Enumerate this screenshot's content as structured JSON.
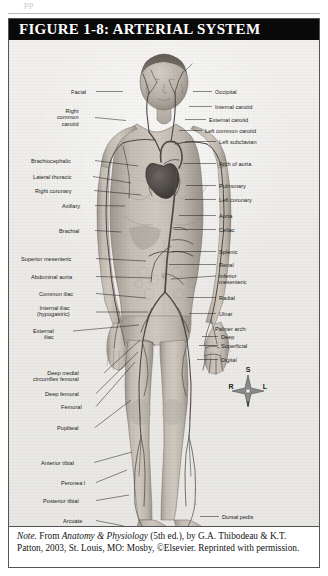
{
  "page": {
    "top_partial_text": "pp"
  },
  "figure": {
    "title": "FIGURE 1-8: ARTERIAL SYSTEM",
    "alt": "Anterior view of the human body showing the major systemic arteries"
  },
  "labels_left": [
    {
      "text": "Facial",
      "x": 62,
      "y": 49,
      "lx1": 87,
      "ly1": 51.5,
      "lx2": 114,
      "ly2": 51.5
    },
    {
      "text": "Right\ncommon\ncarotid",
      "x": 48,
      "y": 68,
      "lx1": 86,
      "ly1": 77.5,
      "lx2": 117,
      "ly2": 80.5
    },
    {
      "text": "Brachiocephalic",
      "x": 22,
      "y": 118,
      "lx1": 86,
      "ly1": 120.5,
      "lx2": 129,
      "ly2": 126
    },
    {
      "text": "Lateral thoracic",
      "x": 24,
      "y": 134,
      "lx1": 84,
      "ly1": 136.5,
      "lx2": 122,
      "ly2": 143
    },
    {
      "text": "Right coronary",
      "x": 26,
      "y": 148,
      "lx1": 85,
      "ly1": 150.5,
      "lx2": 132,
      "ly2": 155
    },
    {
      "text": "Axillary",
      "x": 53,
      "y": 163,
      "lx1": 86,
      "ly1": 165.5,
      "lx2": 116,
      "ly2": 166
    },
    {
      "text": "Brachial",
      "x": 50,
      "y": 188,
      "lx1": 86,
      "ly1": 190.5,
      "lx2": 112,
      "ly2": 192
    },
    {
      "text": "Superior mesenteric",
      "x": 12,
      "y": 216,
      "lx1": 87,
      "ly1": 218.5,
      "lx2": 137,
      "ly2": 221
    },
    {
      "text": "Abdominal aorta",
      "x": 22,
      "y": 234,
      "lx1": 87,
      "ly1": 236.5,
      "lx2": 143,
      "ly2": 238
    },
    {
      "text": "Common iliac",
      "x": 30,
      "y": 251,
      "lx1": 87,
      "ly1": 253.5,
      "lx2": 137,
      "ly2": 258
    },
    {
      "text": "Internal iliac\n(hypogastric)",
      "x": 28,
      "y": 265,
      "lx1": 87,
      "ly1": 272,
      "lx2": 139,
      "ly2": 272
    },
    {
      "text": "External\niliac",
      "x": 24,
      "y": 288,
      "lx1": 64,
      "ly1": 291,
      "lx2": 130,
      "ly2": 285
    },
    {
      "text": "Deep medial\ncircumflex femoral",
      "x": 24,
      "y": 330,
      "lx1": 95,
      "ly1": 333,
      "lx2": 131,
      "ly2": 300
    },
    {
      "text": "Deep femoral",
      "x": 36,
      "y": 351,
      "lx1": 87,
      "ly1": 353.5,
      "lx2": 129,
      "ly2": 312
    },
    {
      "text": "Femoral",
      "x": 52,
      "y": 364,
      "lx1": 87,
      "ly1": 366.5,
      "lx2": 126,
      "ly2": 322
    },
    {
      "text": "Popliteal",
      "x": 48,
      "y": 385,
      "lx1": 86,
      "ly1": 387.5,
      "lx2": 122,
      "ly2": 360
    },
    {
      "text": "Anterior tibial",
      "x": 32,
      "y": 420,
      "lx1": 85,
      "ly1": 422.5,
      "lx2": 123,
      "ly2": 412
    },
    {
      "text": "Peronea l",
      "x": 52,
      "y": 440,
      "lx1": 87,
      "ly1": 442.5,
      "lx2": 118,
      "ly2": 430
    },
    {
      "text": "Posterior tibial",
      "x": 34,
      "y": 458,
      "lx1": 87,
      "ly1": 460.5,
      "lx2": 120,
      "ly2": 455
    },
    {
      "text": "Arcuate",
      "x": 54,
      "y": 478,
      "lx1": 87,
      "ly1": 480.5,
      "lx2": 115,
      "ly2": 486
    },
    {
      "text": "Dorsal\nmetatarsal",
      "x": 38,
      "y": 490,
      "lx1": 85,
      "ly1": 496,
      "lx2": 112,
      "ly2": 496
    }
  ],
  "labels_right": [
    {
      "text": "Occipital",
      "x": 206,
      "y": 49,
      "lx1": 184,
      "ly1": 51.5,
      "lx2": 203,
      "ly2": 51.5
    },
    {
      "text": "Internal carotid",
      "x": 206,
      "y": 64,
      "lx1": 180,
      "ly1": 66.5,
      "lx2": 203,
      "ly2": 66.5
    },
    {
      "text": "External carotid",
      "x": 200,
      "y": 77,
      "lx1": 176,
      "ly1": 79.5,
      "lx2": 197,
      "ly2": 79.5
    },
    {
      "text": "Left common carotid",
      "x": 196,
      "y": 88,
      "lx1": 170,
      "ly1": 90.5,
      "lx2": 193,
      "ly2": 90.5
    },
    {
      "text": "Left subclavian",
      "x": 210,
      "y": 99,
      "lx1": 176,
      "ly1": 101.5,
      "lx2": 207,
      "ly2": 101.5
    },
    {
      "text": "Arch of aorta",
      "x": 210,
      "y": 121,
      "lx1": 174,
      "ly1": 123.5,
      "lx2": 207,
      "ly2": 123.5
    },
    {
      "text": "Pulmonary",
      "x": 210,
      "y": 143,
      "lx1": 177,
      "ly1": 145.5,
      "lx2": 207,
      "ly2": 145.5
    },
    {
      "text": "Left coronary",
      "x": 210,
      "y": 157,
      "lx1": 176,
      "ly1": 159.5,
      "lx2": 207,
      "ly2": 159.5
    },
    {
      "text": "Aorta",
      "x": 210,
      "y": 173,
      "lx1": 170,
      "ly1": 175.5,
      "lx2": 207,
      "ly2": 175.5
    },
    {
      "text": "Celiac",
      "x": 210,
      "y": 187,
      "lx1": 165,
      "ly1": 189.5,
      "lx2": 207,
      "ly2": 189.5
    },
    {
      "text": "Splenic",
      "x": 210,
      "y": 209,
      "lx1": 163,
      "ly1": 211.5,
      "lx2": 207,
      "ly2": 211.5
    },
    {
      "text": "Renal",
      "x": 210,
      "y": 222,
      "lx1": 160,
      "ly1": 224.5,
      "lx2": 207,
      "ly2": 224.5
    },
    {
      "text": "Inferior\nmesenteric",
      "x": 210,
      "y": 233,
      "lx1": 162,
      "ly1": 239,
      "lx2": 207,
      "ly2": 236
    },
    {
      "text": "Radial",
      "x": 210,
      "y": 255,
      "lx1": 178,
      "ly1": 257.5,
      "lx2": 207,
      "ly2": 257.5
    },
    {
      "text": "Ulnar",
      "x": 210,
      "y": 271,
      "lx1": 180,
      "ly1": 273.5,
      "lx2": 207,
      "ly2": 273.5
    },
    {
      "text": "Palmer arch:",
      "x": 206,
      "y": 286,
      "lx1": 0,
      "ly1": 0,
      "lx2": 0,
      "ly2": 0
    },
    {
      "text": "Deep",
      "x": 212,
      "y": 294,
      "lx1": 193,
      "ly1": 296.5,
      "lx2": 209,
      "ly2": 296.5
    },
    {
      "text": "Superficial",
      "x": 212,
      "y": 303,
      "lx1": 190,
      "ly1": 305.5,
      "lx2": 209,
      "ly2": 305.5
    },
    {
      "text": "Digital",
      "x": 212,
      "y": 317,
      "lx1": 188,
      "ly1": 319.5,
      "lx2": 209,
      "ly2": 319.5
    },
    {
      "text": "Dorsal pedis",
      "x": 213,
      "y": 474,
      "lx1": 191,
      "ly1": 476.5,
      "lx2": 210,
      "ly2": 476.5
    }
  ],
  "compass": {
    "superior": "S",
    "inferior": "I",
    "right": "R",
    "left": "L"
  },
  "caption": {
    "note_word": "Note.",
    "text_1": " From ",
    "source_title": "Anatomy & Physiology",
    "text_2": " (5th ed.), by G.A. Thibodeau & K.T. Patton, 2003, St. Louis, MO: Mosby, ©Elsevier. Reprinted with permission."
  },
  "colors": {
    "title_bar": "#0a0a0a",
    "title_text": "#ffffff",
    "border": "#555555",
    "paper": "#efeeec",
    "caption_bg": "#ffffff",
    "label_text": "#1b1b1b",
    "artery": "#5a5a5a",
    "skin": "#b9b3ab"
  }
}
